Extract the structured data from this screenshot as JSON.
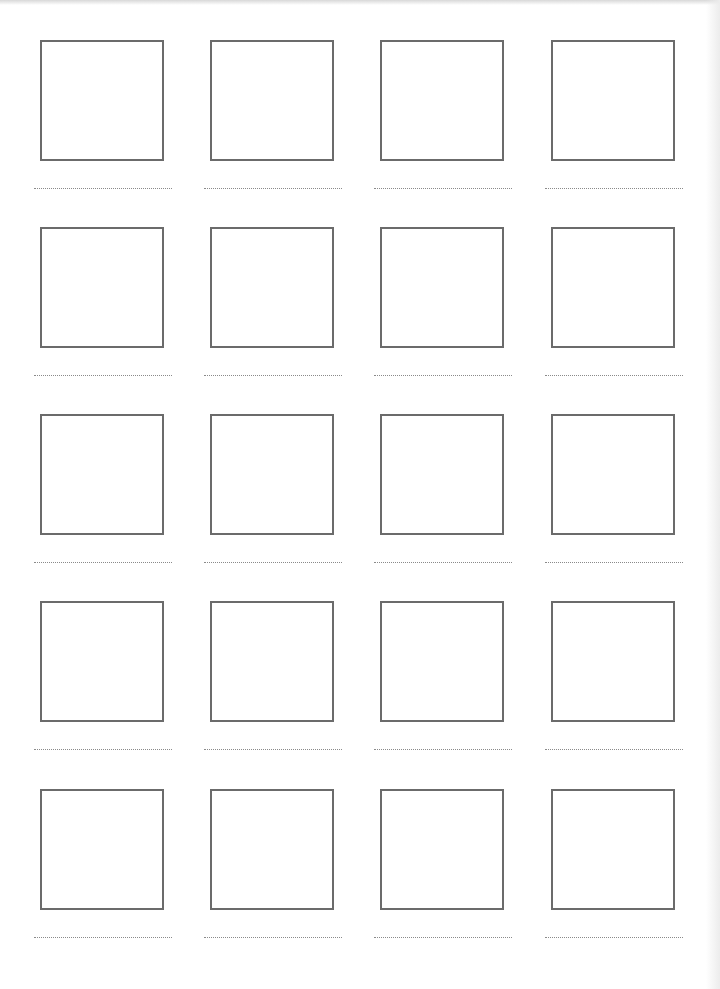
{
  "worksheet": {
    "rows": 5,
    "columns": 4,
    "box_color": "#6b6b6b",
    "line_color": "#8a8a8a",
    "column_x": [
      40,
      210,
      380,
      551
    ],
    "row_y": [
      40,
      227,
      414,
      601,
      789
    ],
    "cells": [
      {
        "row": 0,
        "col": 0,
        "label": ""
      },
      {
        "row": 0,
        "col": 1,
        "label": ""
      },
      {
        "row": 0,
        "col": 2,
        "label": ""
      },
      {
        "row": 0,
        "col": 3,
        "label": ""
      },
      {
        "row": 1,
        "col": 0,
        "label": ""
      },
      {
        "row": 1,
        "col": 1,
        "label": ""
      },
      {
        "row": 1,
        "col": 2,
        "label": ""
      },
      {
        "row": 1,
        "col": 3,
        "label": ""
      },
      {
        "row": 2,
        "col": 0,
        "label": ""
      },
      {
        "row": 2,
        "col": 1,
        "label": ""
      },
      {
        "row": 2,
        "col": 2,
        "label": ""
      },
      {
        "row": 2,
        "col": 3,
        "label": ""
      },
      {
        "row": 3,
        "col": 0,
        "label": ""
      },
      {
        "row": 3,
        "col": 1,
        "label": ""
      },
      {
        "row": 3,
        "col": 2,
        "label": ""
      },
      {
        "row": 3,
        "col": 3,
        "label": ""
      },
      {
        "row": 4,
        "col": 0,
        "label": ""
      },
      {
        "row": 4,
        "col": 1,
        "label": ""
      },
      {
        "row": 4,
        "col": 2,
        "label": ""
      },
      {
        "row": 4,
        "col": 3,
        "label": ""
      }
    ]
  }
}
